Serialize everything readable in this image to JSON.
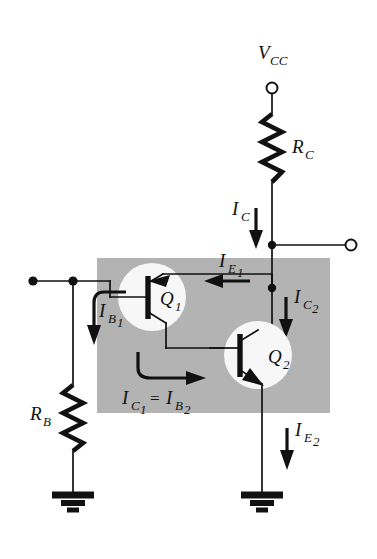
{
  "figure": {
    "background_color": "#ffffff",
    "shade_color": "#b3b3b3",
    "line_color": "#111111",
    "device_circle_color": "#f7f7f7"
  },
  "supply": {
    "label_main": "V",
    "label_sub": "CC",
    "terminal_name": "vcc-terminal"
  },
  "output": {
    "terminal_name": "output-terminal"
  },
  "input": {
    "terminal_name": "input-terminal"
  },
  "resistors": [
    {
      "id": "rc",
      "label_main": "R",
      "label_sub": "C"
    },
    {
      "id": "rb",
      "label_main": "R",
      "label_sub": "B"
    }
  ],
  "transistors": [
    {
      "id": "q1",
      "label_main": "Q",
      "label_sub": "1"
    },
    {
      "id": "q2",
      "label_main": "Q",
      "label_sub": "2"
    }
  ],
  "currents": [
    {
      "id": "ic",
      "label_main": "I",
      "label_sub": "C",
      "direction": "down"
    },
    {
      "id": "ie1",
      "label_main": "I",
      "label_sub": "E",
      "label_sub2": "1",
      "direction": "left"
    },
    {
      "id": "ic2",
      "label_main": "I",
      "label_sub": "C",
      "label_sub2": "2",
      "direction": "down"
    },
    {
      "id": "ib1",
      "label_main": "I",
      "label_sub": "B",
      "label_sub2": "1",
      "direction": "down"
    },
    {
      "id": "ic1",
      "label_main": "I",
      "label_sub": "C",
      "label_sub2": "1",
      "direction": "right"
    },
    {
      "id": "ib2",
      "label_main": "I",
      "label_sub": "B",
      "label_sub2": "2"
    },
    {
      "id": "ie2",
      "label_main": "I",
      "label_sub": "E",
      "label_sub2": "2",
      "direction": "down"
    }
  ],
  "equation": {
    "equals": "="
  },
  "grounds": [
    {
      "id": "ground-left"
    },
    {
      "id": "ground-right"
    }
  ]
}
